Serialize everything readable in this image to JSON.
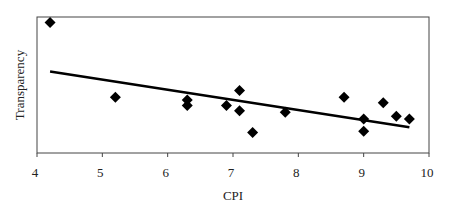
{
  "chart_data": {
    "type": "scatter",
    "title": "",
    "xlabel": "CPI",
    "ylabel": "Transparency",
    "xlim": [
      4,
      10
    ],
    "ylim": [
      0,
      10
    ],
    "x_ticks": [
      "4",
      "5",
      "6",
      "7",
      "8",
      "9",
      "10"
    ],
    "y_ticks": [],
    "grid": false,
    "legend": null,
    "marker": "diamond",
    "marker_color": "#000000",
    "series": [
      {
        "name": "Countries",
        "points": [
          {
            "x": 4.2,
            "y": 9.6
          },
          {
            "x": 5.2,
            "y": 4.1
          },
          {
            "x": 6.3,
            "y": 3.9
          },
          {
            "x": 6.3,
            "y": 3.5
          },
          {
            "x": 6.9,
            "y": 3.5
          },
          {
            "x": 7.1,
            "y": 4.6
          },
          {
            "x": 7.1,
            "y": 3.1
          },
          {
            "x": 7.3,
            "y": 1.5
          },
          {
            "x": 7.8,
            "y": 3.0
          },
          {
            "x": 8.7,
            "y": 4.1
          },
          {
            "x": 9.0,
            "y": 2.5
          },
          {
            "x": 9.0,
            "y": 1.6
          },
          {
            "x": 9.3,
            "y": 3.7
          },
          {
            "x": 9.5,
            "y": 2.7
          },
          {
            "x": 9.7,
            "y": 2.5
          }
        ]
      }
    ],
    "trendline": {
      "type": "linear",
      "color": "#000000",
      "from": {
        "x": 4.2,
        "y": 6.0
      },
      "to": {
        "x": 9.7,
        "y": 1.9
      }
    }
  }
}
